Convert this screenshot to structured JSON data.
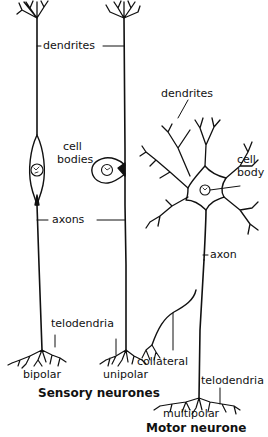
{
  "diagram": {
    "type": "biology-illustration",
    "line_color": "#111111",
    "background": "#ffffff"
  },
  "sensory": {
    "title": "Sensory neurones",
    "labels": {
      "dendrites": "dendrites",
      "cell_bodies_line1": "cell",
      "cell_bodies_line2": "bodies",
      "axons": "axons",
      "telodendria": "telodendria",
      "bipolar": "bipolar",
      "unipolar": "unipolar"
    }
  },
  "motor": {
    "title": "Motor neurone",
    "labels": {
      "dendrites": "dendrites",
      "cell_body_line1": "cell",
      "cell_body_line2": "body",
      "axon": "axon",
      "collateral": "collateral",
      "telodendria": "telodendria",
      "multipolar": "multipolar"
    }
  }
}
